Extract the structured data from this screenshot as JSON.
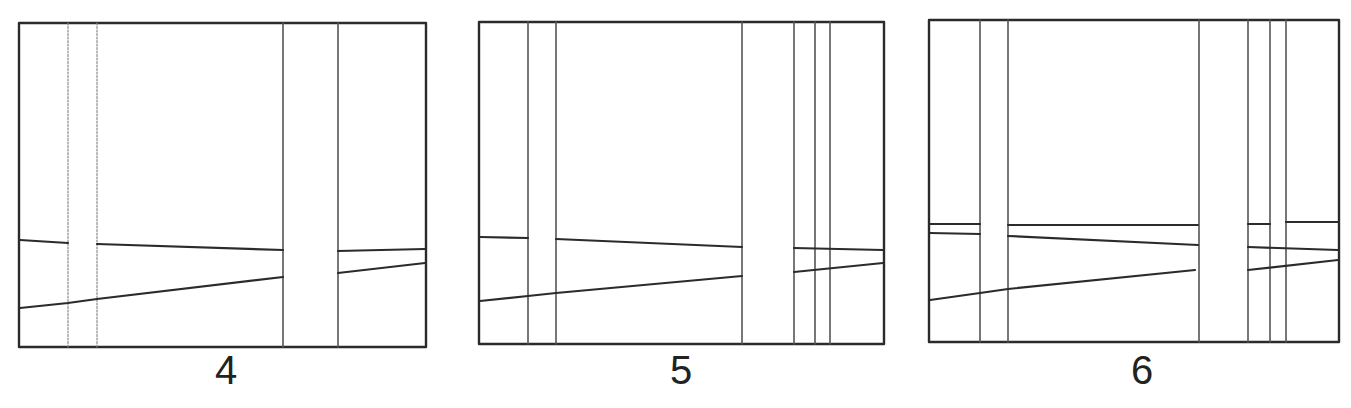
{
  "figure": {
    "panels": [
      {
        "label": "4",
        "frame": {
          "x1": 19,
          "y1": 23,
          "x2": 426,
          "y2": 347
        },
        "vertical_strips": [
          {
            "left": 68,
            "right": 97,
            "style": "faint"
          },
          {
            "left": 283,
            "right": 338,
            "style": "mid"
          }
        ],
        "upper_lines": [
          [
            [
              20,
              240
            ],
            [
              68,
              243
            ]
          ],
          [
            [
              97,
              244
            ],
            [
              283,
              250
            ]
          ],
          [
            [
              338,
              251
            ],
            [
              425,
              249
            ]
          ]
        ],
        "lower_lines": [
          [
            [
              20,
              308
            ],
            [
              68,
              303
            ],
            [
              97,
              299
            ],
            [
              283,
              277
            ]
          ],
          [
            [
              338,
              273
            ],
            [
              425,
              263
            ]
          ]
        ]
      },
      {
        "label": "5",
        "frame": {
          "x1": 479,
          "y1": 22,
          "x2": 884,
          "y2": 344
        },
        "vertical_strips": [
          {
            "left": 528,
            "right": 556,
            "style": "mid"
          },
          {
            "left": 742,
            "right": 794,
            "style": "mid"
          },
          {
            "left": 815,
            "right": 830,
            "style": "mid"
          }
        ],
        "upper_lines": [
          [
            [
              480,
              237
            ],
            [
              528,
              238
            ]
          ],
          [
            [
              556,
              239
            ],
            [
              742,
              247
            ]
          ],
          [
            [
              794,
              248
            ],
            [
              883,
              250
            ]
          ]
        ],
        "lower_lines": [
          [
            [
              480,
              301
            ],
            [
              528,
              296
            ],
            [
              556,
              293
            ],
            [
              742,
              276
            ]
          ],
          [
            [
              794,
              272
            ],
            [
              883,
              263
            ]
          ]
        ]
      },
      {
        "label": "6",
        "frame": {
          "x1": 929,
          "y1": 20,
          "x2": 1339,
          "y2": 342
        },
        "vertical_strips": [
          {
            "left": 980,
            "right": 1008,
            "style": "mid"
          },
          {
            "left": 1199,
            "right": 1248,
            "style": "mid"
          },
          {
            "left": 1270,
            "right": 1286,
            "style": "mid"
          }
        ],
        "upper_lines": [
          [
            [
              930,
              224
            ],
            [
              980,
              224
            ]
          ],
          [
            [
              930,
              233
            ],
            [
              980,
              234
            ]
          ],
          [
            [
              1008,
              225
            ],
            [
              1198,
              225
            ]
          ],
          [
            [
              1008,
              236
            ],
            [
              1198,
              245
            ]
          ],
          [
            [
              1248,
              224
            ],
            [
              1270,
              224
            ]
          ],
          [
            [
              1286,
              222
            ],
            [
              1338,
              222
            ]
          ],
          [
            [
              1248,
              247
            ],
            [
              1338,
              250
            ]
          ]
        ],
        "lower_lines": [
          [
            [
              930,
              300
            ],
            [
              980,
              293
            ],
            [
              1008,
              289
            ],
            [
              1195,
              270
            ]
          ],
          [
            [
              1248,
              270
            ],
            [
              1338,
              260
            ]
          ]
        ]
      }
    ]
  },
  "labels": {
    "panel_4": "4",
    "panel_5": "5",
    "panel_6": "6"
  }
}
